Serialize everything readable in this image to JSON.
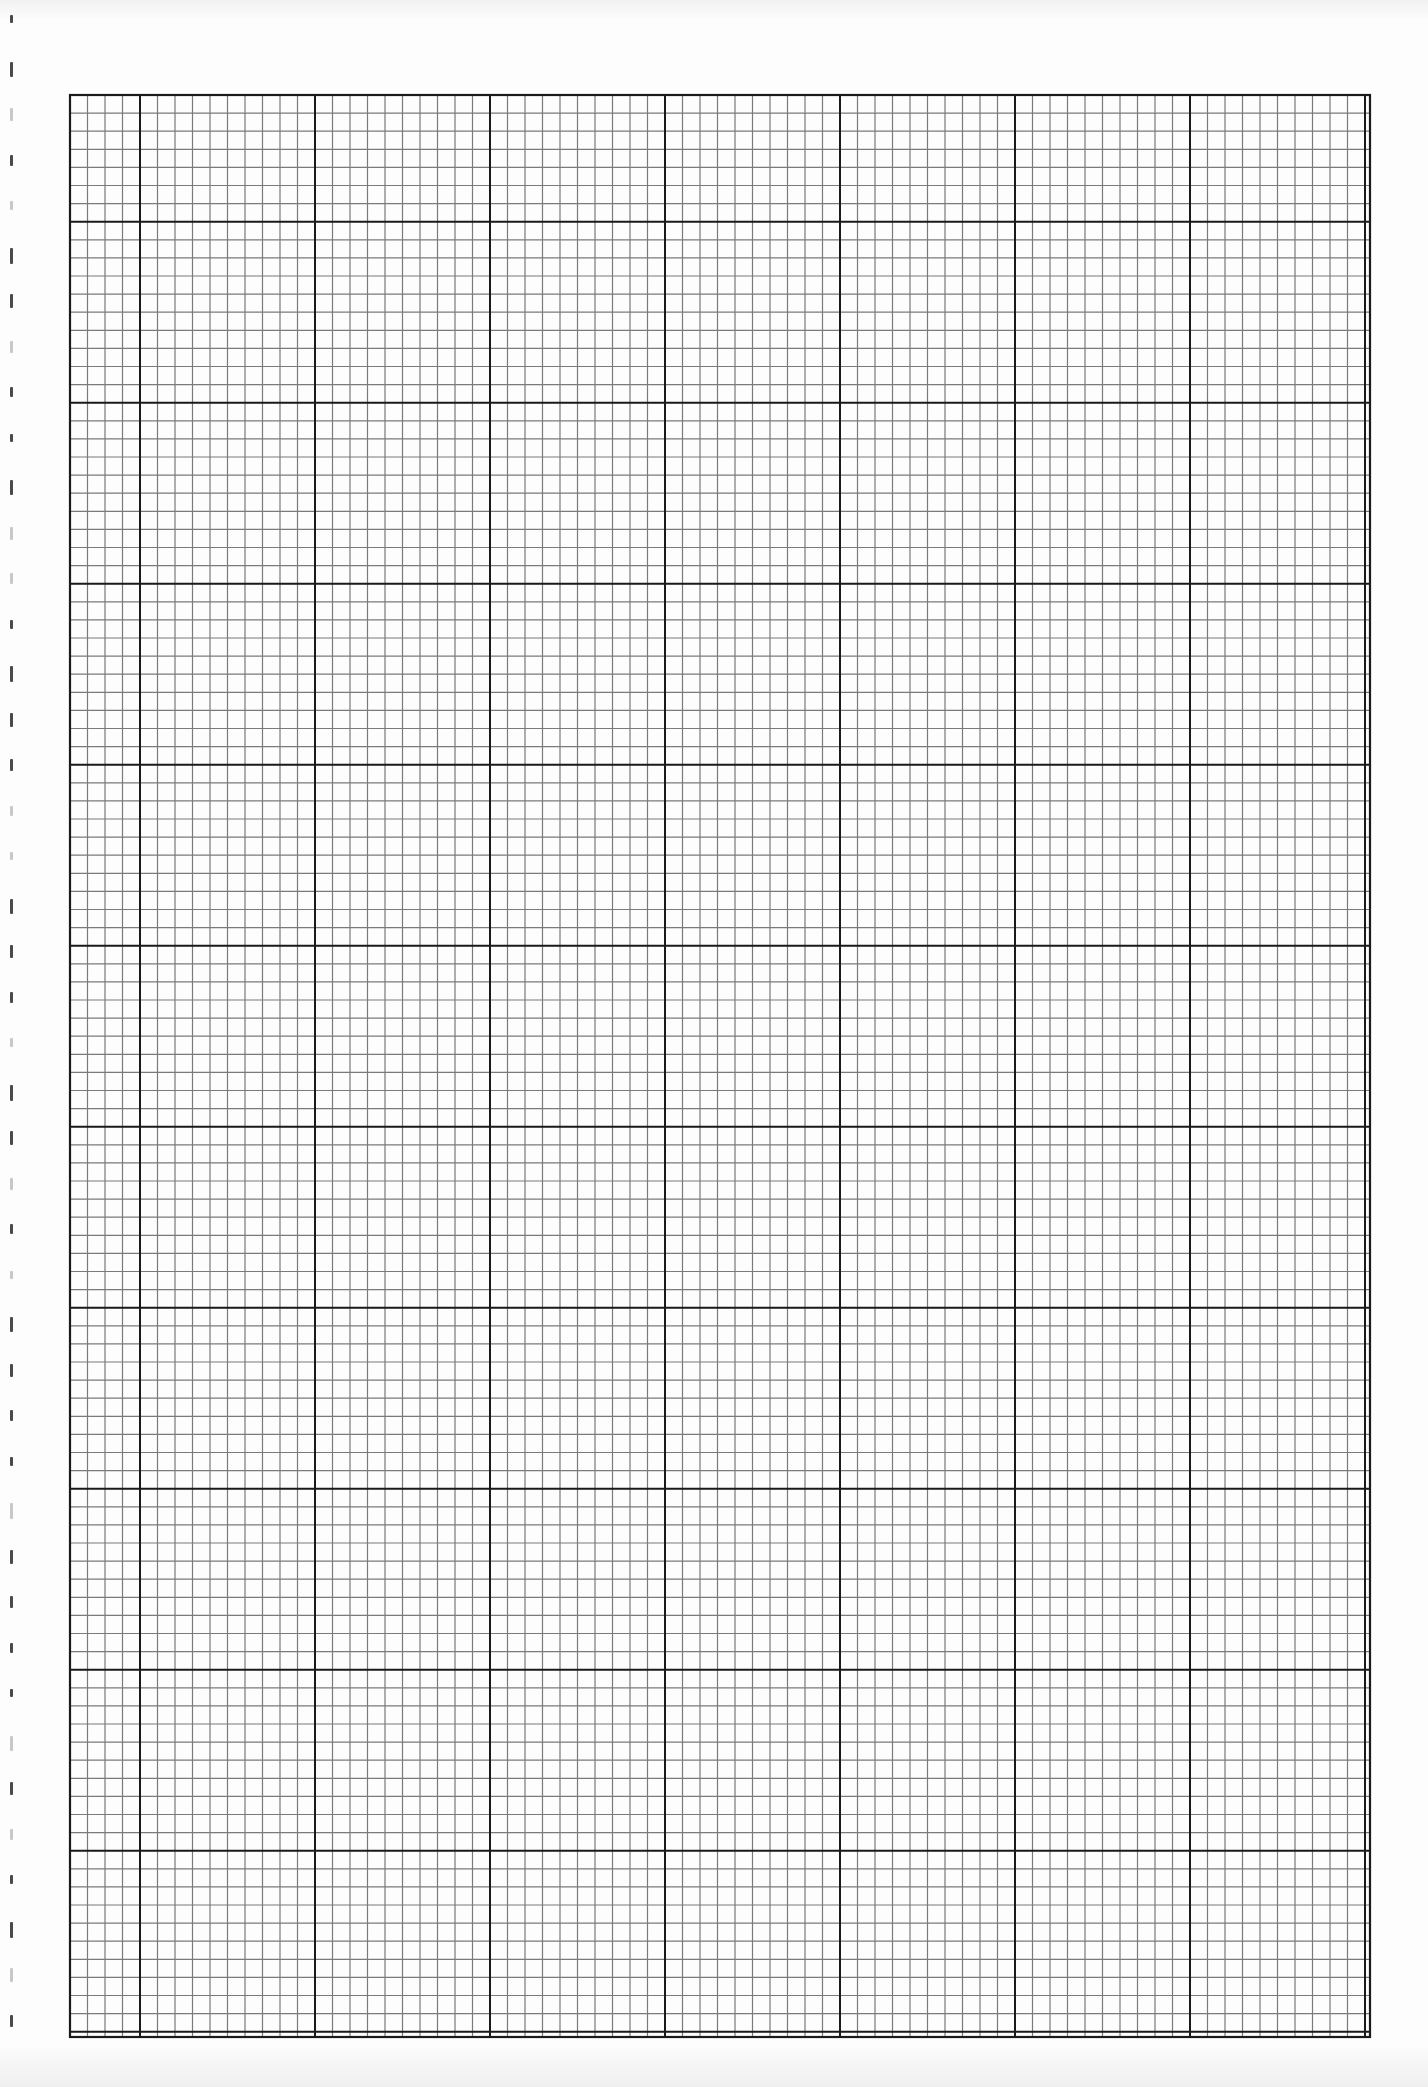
{
  "page": {
    "type": "graph paper sheet",
    "background_color": "#fdfdfd"
  },
  "grid": {
    "left": 70,
    "top": 95,
    "right": 1370,
    "bottom": 2037,
    "minor_cell_width": 17.5,
    "minor_cell_height": 18.1,
    "cells_per_major": 10,
    "first_major_col_offset": 4,
    "first_major_row_offset": 7,
    "minor_line_color": "#7a7a7a",
    "major_line_color": "#1a1a1a",
    "border_color": "#1a1a1a",
    "minor_line_width": 1.2,
    "major_line_width": 2
  },
  "binding_marks": {
    "color": "#2a2a2a",
    "count": 44
  }
}
